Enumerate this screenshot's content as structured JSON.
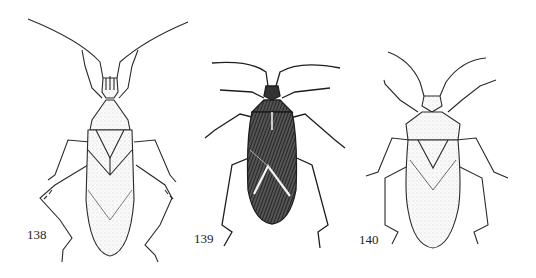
{
  "plate": {
    "figures": [
      {
        "number": "138",
        "style": "light stippled, long antennae, spined hind femora"
      },
      {
        "number": "139",
        "style": "dark hatched, pale X-stripes on hemelytra"
      },
      {
        "number": "140",
        "style": "light stippled, hairy legs"
      }
    ]
  },
  "colors": {
    "ink": "#2a2a2a",
    "paper": "#ffffff",
    "dark_fill": "#3a3a3a",
    "light_fill": "#eeeeee"
  }
}
